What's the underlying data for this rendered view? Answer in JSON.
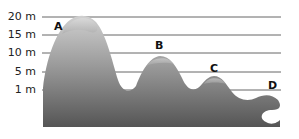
{
  "axis": {
    "unit": "m",
    "labels": [
      {
        "text": "20 m",
        "value": 20,
        "y": 17
      },
      {
        "text": "15 m",
        "value": 15,
        "y": 35
      },
      {
        "text": "10 m",
        "value": 10,
        "y": 53
      },
      {
        "text": "5 m",
        "value": 5,
        "y": 72
      },
      {
        "text": "1 m",
        "value": 1,
        "y": 90
      }
    ]
  },
  "peaks": [
    {
      "label": "A",
      "height_m": 20
    },
    {
      "label": "B",
      "height_m": 10
    },
    {
      "label": "C",
      "height_m": 5
    },
    {
      "label": "D",
      "height_m": 1
    }
  ],
  "colors": {
    "grid_line": "#666666",
    "terrain_top": "#bdbdbd",
    "terrain_bottom": "#5a5a5a",
    "text": "#222222"
  }
}
